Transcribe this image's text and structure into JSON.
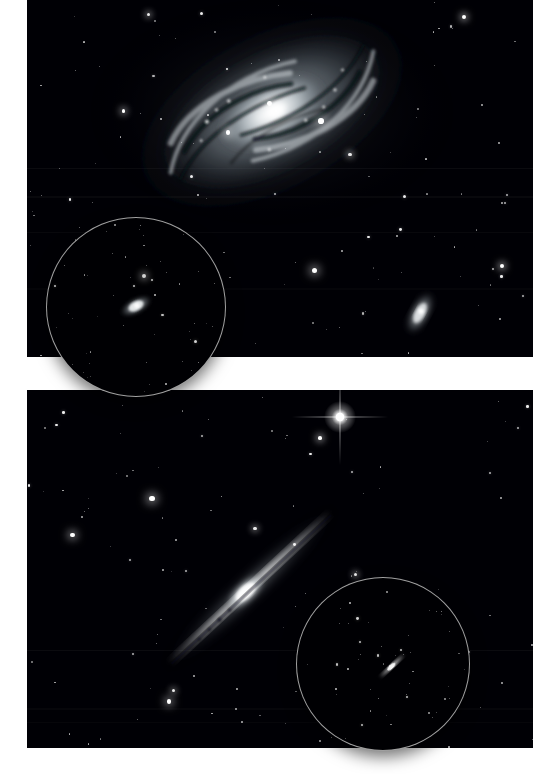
{
  "figure": {
    "background_color": "#ffffff",
    "width": 533,
    "height": 774,
    "panel_count": 2,
    "inset_stroke_color": "#d7d7d7",
    "sky_color": "#000005"
  },
  "panels": [
    {
      "id": "panel-top",
      "name": "top-panel",
      "x": 27,
      "y": 0,
      "width": 506,
      "height": 357,
      "description": "Wide-field monochrome image of a bright face-on barred spiral galaxy with prominent dust lanes, a luminous core and a small edge-on companion galaxy at lower right.",
      "primary_object": {
        "type": "spiral-galaxy",
        "orientation": "inclined face-on",
        "center_x": 272,
        "center_y": 112,
        "major_axis_px": 236,
        "minor_axis_px": 120,
        "position_angle_deg": -28,
        "core_brightness": "very bright",
        "features": [
          "spiral arms",
          "dust lanes",
          "bright nucleus",
          "outer halo"
        ]
      },
      "companion_object": {
        "type": "edge-on-galaxy",
        "center_x": 393,
        "center_y": 313,
        "major_axis_px": 40,
        "minor_axis_px": 17,
        "position_angle_deg": -62
      },
      "star_count": 118
    },
    {
      "id": "panel-bottom",
      "name": "bottom-panel",
      "x": 27,
      "y": 390,
      "width": 506,
      "height": 358,
      "description": "Wide-field monochrome image of a thin edge-on spiral galaxy crossing the frame diagonally, with a bright foreground star showing diffraction spikes near the top.",
      "primary_object": {
        "type": "edge-on-spiral-galaxy",
        "orientation": "edge-on",
        "center_x": 250,
        "center_y": 588,
        "major_axis_px": 190,
        "minor_axis_px": 17,
        "position_angle_deg": -43,
        "core_brightness": "bright bulge",
        "features": [
          "thin disk",
          "central dust lane",
          "bright bulge"
        ]
      },
      "bright_star": {
        "type": "foreground-star",
        "center_x": 313,
        "center_y": 417,
        "size_px": 9,
        "has_diffraction_spikes": true
      },
      "star_count": 104
    }
  ],
  "insets": [
    {
      "id": "inset-top",
      "name": "top-inset-circle",
      "x": 46,
      "y": 217,
      "diameter": 178,
      "shape": "circle",
      "description": "Circular context inset showing the same spiral galaxy rendered small, as it appears at a wider field scale.",
      "object": {
        "type": "spiral-galaxy",
        "center_x": 135,
        "center_y": 305,
        "major_axis_px": 32,
        "minor_axis_px": 15,
        "position_angle_deg": -28
      },
      "star_count": 52,
      "overflows_panel": true
    },
    {
      "id": "inset-bottom",
      "name": "bottom-inset-circle",
      "x": 296,
      "y": 577,
      "diameter": 172,
      "shape": "circle",
      "description": "Circular context inset showing the same edge-on galaxy rendered small, as it appears at a wider field scale.",
      "object": {
        "type": "edge-on-spiral-galaxy",
        "center_x": 391,
        "center_y": 665,
        "major_axis_px": 34,
        "minor_axis_px": 6,
        "position_angle_deg": -43
      },
      "star_count": 48,
      "overflows_panel": true
    }
  ],
  "gap": {
    "name": "panel-gap",
    "y_start": 357,
    "y_end": 390,
    "color": "#ffffff"
  }
}
